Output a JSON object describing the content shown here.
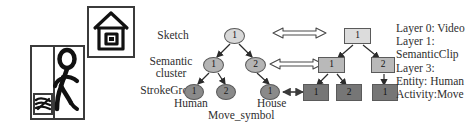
{
  "figure": {
    "sketch_panels": [
      {
        "name": "human-running-sketch",
        "caption": ""
      },
      {
        "name": "house-sketch",
        "caption": ""
      }
    ],
    "hierarchy_labels": {
      "level0": "Sketch",
      "level1_line1": "Semantic",
      "level1_line2": "cluster",
      "level3": "StrokeGroup"
    },
    "sketch_tree": {
      "nodes": [
        {
          "id": "s0",
          "label": "1",
          "layer": 0,
          "x": 234,
          "y": 36
        },
        {
          "id": "s1a",
          "label": "1",
          "layer": 1,
          "x": 213,
          "y": 65
        },
        {
          "id": "s1b",
          "label": "2",
          "layer": 1,
          "x": 255,
          "y": 65
        },
        {
          "id": "s3a",
          "label": "1",
          "layer": 3,
          "x": 194,
          "y": 92
        },
        {
          "id": "s3b",
          "label": "2",
          "layer": 3,
          "x": 226,
          "y": 92
        },
        {
          "id": "s3c",
          "label": "1",
          "layer": 3,
          "x": 270,
          "y": 92
        }
      ],
      "leaf_captions": {
        "human": "Human",
        "move_symbol": "Move_symbol",
        "house": "House"
      }
    },
    "video_tree": {
      "nodes": [
        {
          "id": "v0",
          "label": "1",
          "layer": 0,
          "x": 357,
          "y": 36
        },
        {
          "id": "v1a",
          "label": "1",
          "layer": 1,
          "x": 330,
          "y": 65
        },
        {
          "id": "v1b",
          "label": "2",
          "layer": 1,
          "x": 382,
          "y": 65
        },
        {
          "id": "v3a",
          "label": "1",
          "layer": 3,
          "x": 311,
          "y": 92
        },
        {
          "id": "v3b",
          "label": "2",
          "layer": 3,
          "x": 345,
          "y": 92
        },
        {
          "id": "v3c",
          "label": "1",
          "layer": 3,
          "x": 381,
          "y": 92
        }
      ]
    },
    "correspondence_arrows": [
      {
        "name": "layer0-correspondence",
        "style": "hollow-double-headed",
        "layer": 0
      },
      {
        "name": "layer1-correspondence",
        "style": "hollow-double-headed",
        "layer": 1
      },
      {
        "name": "layer3-correspondence",
        "style": "solid-double-headed",
        "layer": 3
      }
    ],
    "legend": [
      "Layer 0: Video",
      "Layer 1:",
      "SemanticClip",
      "Layer 3:",
      "Entity: Human",
      "Activity:Move"
    ],
    "colors": {
      "layer0_fill": "#d8d8d8",
      "layer1_fill": "#b4b4b4",
      "layer3_ellipse_fill": "#8a8a8a",
      "layer3_rect_fill": "#767676",
      "stroke": "#5a5a5a",
      "text": "#2e2e2e",
      "ink": "#1a1a1a"
    }
  }
}
